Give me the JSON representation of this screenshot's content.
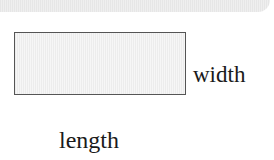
{
  "diagram": {
    "shape": "rectangle",
    "labels": {
      "width": "width",
      "length": "length"
    }
  }
}
